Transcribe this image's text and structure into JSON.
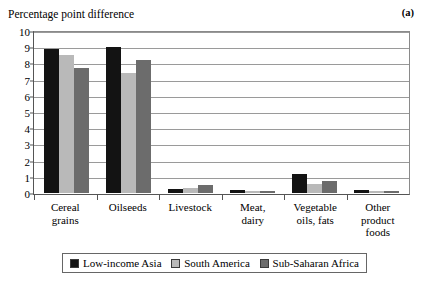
{
  "axis_title": "Percentage point difference",
  "panel_label": "(a)",
  "colors": {
    "series_low_income_asia": "#131313",
    "series_south_america": "#b9b9b9",
    "series_sub_saharan_africa": "#6c6c6c",
    "gridline": "#9a9a9a",
    "axis": "#555555",
    "background": "#ffffff"
  },
  "legend": {
    "items": [
      {
        "label": "Low-income Asia",
        "color": "#131313"
      },
      {
        "label": "South America",
        "color": "#b9b9b9"
      },
      {
        "label": "Sub-Saharan Africa",
        "color": "#6c6c6c"
      }
    ]
  },
  "chart_data": {
    "type": "bar",
    "title": "",
    "xlabel": "",
    "ylabel": "Percentage point difference",
    "ylim": [
      0,
      10
    ],
    "yticks": [
      0,
      1,
      2,
      3,
      4,
      5,
      6,
      7,
      8,
      9,
      10
    ],
    "ytick_labels": [
      "0",
      "1",
      "2",
      "3",
      "4",
      "5",
      "6",
      "7",
      "8",
      "9",
      "10"
    ],
    "grid": true,
    "legend_position": "bottom",
    "categories": [
      "Cereal grains",
      "Oilseeds",
      "Livestock",
      "Meat, dairy",
      "Vegetable oils, fats",
      "Other product foods"
    ],
    "category_lines": [
      [
        "Cereal",
        "grains"
      ],
      [
        "Oilseeds"
      ],
      [
        "Livestock"
      ],
      [
        "Meat,",
        "dairy"
      ],
      [
        "Vegetable",
        "oils, fats"
      ],
      [
        "Other",
        "product",
        "foods"
      ]
    ],
    "series": [
      {
        "name": "Low-income Asia",
        "color": "#131313",
        "values": [
          8.9,
          9.0,
          0.25,
          0.2,
          1.2,
          0.2
        ]
      },
      {
        "name": "South America",
        "color": "#b9b9b9",
        "values": [
          8.5,
          7.4,
          0.3,
          0.15,
          0.55,
          0.15
        ]
      },
      {
        "name": "Sub-Saharan Africa",
        "color": "#6c6c6c",
        "values": [
          7.7,
          8.2,
          0.5,
          0.1,
          0.75,
          0.15
        ]
      }
    ]
  }
}
